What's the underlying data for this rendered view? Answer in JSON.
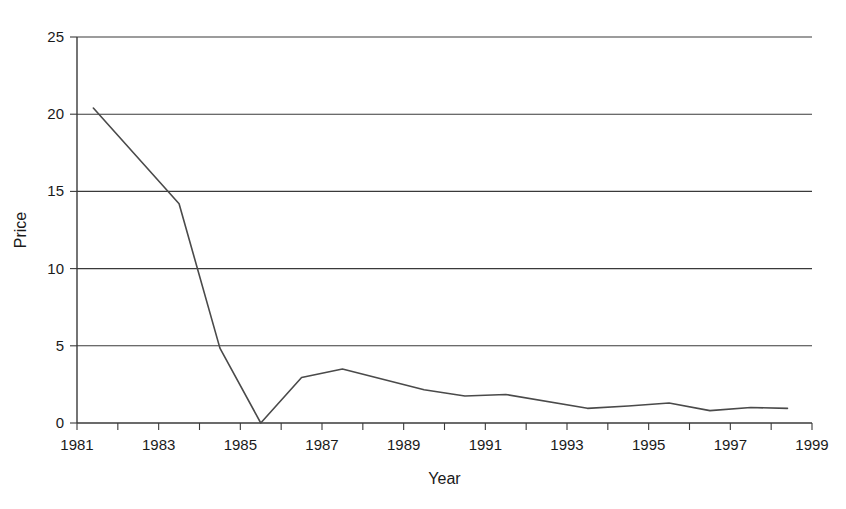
{
  "chart_data": {
    "type": "line",
    "title": "",
    "xlabel": "Year",
    "ylabel": "Price",
    "xlim": [
      1981,
      1999
    ],
    "ylim": [
      0,
      25
    ],
    "grid": true,
    "legend": null,
    "y_ticks": [
      0,
      5,
      10,
      15,
      20,
      25
    ],
    "y_tick_labels": [
      "0",
      "5",
      "10",
      "15",
      "20",
      "25"
    ],
    "x_ticks": [
      1981,
      1982,
      1983,
      1984,
      1985,
      1986,
      1987,
      1988,
      1989,
      1990,
      1991,
      1992,
      1993,
      1994,
      1995,
      1996,
      1997,
      1998,
      1999
    ],
    "x_tick_labels_shown": [
      "1981",
      "1983",
      "1985",
      "1987",
      "1989",
      "1991",
      "1993",
      "1995",
      "1997",
      "1999"
    ],
    "series": [
      {
        "name": "Price",
        "x": [
          1981.4,
          1983.5,
          1984.5,
          1985.5,
          1986.5,
          1987.5,
          1989.5,
          1990.5,
          1991.5,
          1993.5,
          1994.5,
          1995.5,
          1996.5,
          1997.5,
          1998.4
        ],
        "values": [
          20.4,
          14.2,
          4.85,
          0.0,
          2.95,
          3.5,
          2.15,
          1.75,
          1.85,
          0.95,
          1.1,
          1.3,
          0.8,
          1.0,
          0.95
        ]
      }
    ],
    "colors": {
      "line": "#4a4a4a",
      "grid": "#3a3a3a",
      "axis": "#3a3a3a",
      "text": "#1a1a1a",
      "background": "#ffffff"
    }
  }
}
